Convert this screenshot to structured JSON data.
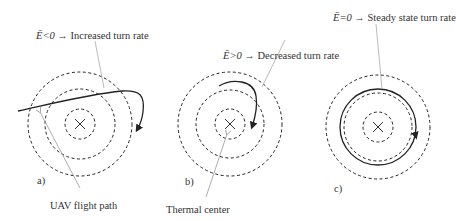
{
  "diagram": {
    "panels": [
      {
        "id": "a",
        "label": "a)",
        "condition": "Ē<0 →",
        "description": "Increased turn rate"
      },
      {
        "id": "b",
        "label": "b)",
        "condition": "Ē>0 →",
        "description": "Decreased turn rate"
      },
      {
        "id": "c",
        "label": "c)",
        "condition": "Ē=0 →",
        "description": "Steady state turn rate"
      }
    ],
    "callouts": {
      "flight_path": "UAV flight path",
      "thermal_center": "Thermal center"
    },
    "colors": {
      "stroke": "#222222",
      "leader": "#999999",
      "background": "#ffffff"
    }
  }
}
